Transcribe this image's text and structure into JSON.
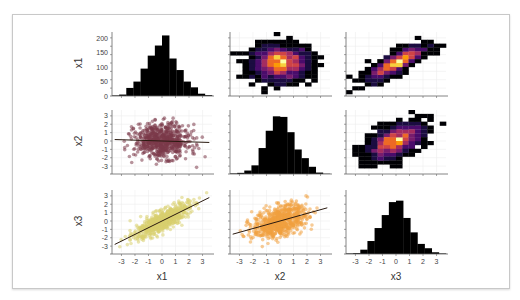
{
  "figure": {
    "type": "pairplot",
    "variables": [
      "x1",
      "x2",
      "x3"
    ]
  },
  "chart_data": [
    {
      "type": "bar",
      "panel": "row1-col1",
      "title": "",
      "xlabel": "",
      "ylabel": "x1",
      "yticks": [
        0,
        50,
        100,
        150,
        200
      ],
      "ylim": [
        0,
        215
      ],
      "bin_edges": [
        -3.5,
        -3,
        -2.5,
        -2,
        -1.5,
        -1,
        -0.5,
        0,
        0.5,
        1,
        1.5,
        2,
        2.5,
        3,
        3.5
      ],
      "values": [
        2,
        5,
        28,
        50,
        95,
        140,
        175,
        210,
        130,
        90,
        50,
        30,
        8,
        3
      ]
    },
    {
      "type": "heatmap",
      "panel": "row1-col2",
      "x": "x2",
      "y": "x1",
      "description": "2D histogram, roughly circular density (no correlation), peak at center (orange/yellow)"
    },
    {
      "type": "heatmap",
      "panel": "row1-col3",
      "x": "x3",
      "y": "x1",
      "description": "2D histogram, strong positive correlation, elongated diagonal density"
    },
    {
      "type": "scatter",
      "panel": "row2-col1",
      "x": "x1",
      "y": "x2",
      "ylabel": "x2",
      "yticks": [
        -3,
        -2,
        -1,
        0,
        1,
        2,
        3
      ],
      "color": "#7b3a4a",
      "regression_line": {
        "slope": -0.05,
        "intercept": 0.05
      }
    },
    {
      "type": "bar",
      "panel": "row2-col2",
      "xlabel": "",
      "ylabel": "",
      "bin_edges": [
        -3.5,
        -3,
        -2.5,
        -2,
        -1.5,
        -1,
        -0.5,
        0,
        0.5,
        1,
        1.5,
        2,
        2.5,
        3,
        3.5
      ],
      "values": [
        2,
        4,
        12,
        30,
        90,
        150,
        200,
        198,
        145,
        85,
        55,
        25,
        5,
        1
      ]
    },
    {
      "type": "heatmap",
      "panel": "row2-col3",
      "x": "x3",
      "y": "x2",
      "description": "2D histogram, moderate positive correlation"
    },
    {
      "type": "scatter",
      "panel": "row3-col1",
      "x": "x1",
      "y": "x3",
      "xlabel": "x1",
      "ylabel": "x3",
      "xticks": [
        -3,
        -2,
        -1,
        0,
        1,
        2,
        3
      ],
      "yticks": [
        -3,
        -2,
        -1,
        0,
        1,
        2,
        3
      ],
      "color": "#d8d070",
      "regression_line": {
        "slope": 0.8,
        "intercept": 0
      }
    },
    {
      "type": "scatter",
      "panel": "row3-col2",
      "x": "x2",
      "y": "x3",
      "xlabel": "x2",
      "xticks": [
        -3,
        -2,
        -1,
        0,
        1,
        2,
        3
      ],
      "color": "#f0a040",
      "regression_line": {
        "slope": 0.45,
        "intercept": 0
      }
    },
    {
      "type": "bar",
      "panel": "row3-col3",
      "xlabel": "x3",
      "xticks": [
        -3,
        -2,
        -1,
        0,
        1,
        2,
        3
      ],
      "bin_edges": [
        -3.5,
        -3,
        -2.5,
        -2,
        -1.5,
        -1,
        -0.5,
        0,
        0.5,
        1,
        1.5,
        2,
        2.5,
        3,
        3.5
      ],
      "values": [
        2,
        3,
        15,
        45,
        90,
        135,
        180,
        185,
        125,
        75,
        35,
        20,
        6,
        2
      ]
    }
  ],
  "labels": {
    "row_labels": [
      "x1",
      "x2",
      "x3"
    ],
    "col_labels": [
      "x1",
      "x2",
      "x3"
    ],
    "hist_yticks": [
      "200",
      "150",
      "100",
      "50",
      "0"
    ],
    "scatter_yticks": [
      "3",
      "2",
      "1",
      "0",
      "-1",
      "-2",
      "-3"
    ],
    "xticks": [
      "-3",
      "-2",
      "-1",
      "0",
      "1",
      "2",
      "3"
    ]
  },
  "colors": {
    "hist": "#000000",
    "scatter_x1x2": "#7b3a4a",
    "scatter_x1x3": "#d8d070",
    "scatter_x2x3": "#f0a040",
    "regline": "#2a1a10"
  }
}
